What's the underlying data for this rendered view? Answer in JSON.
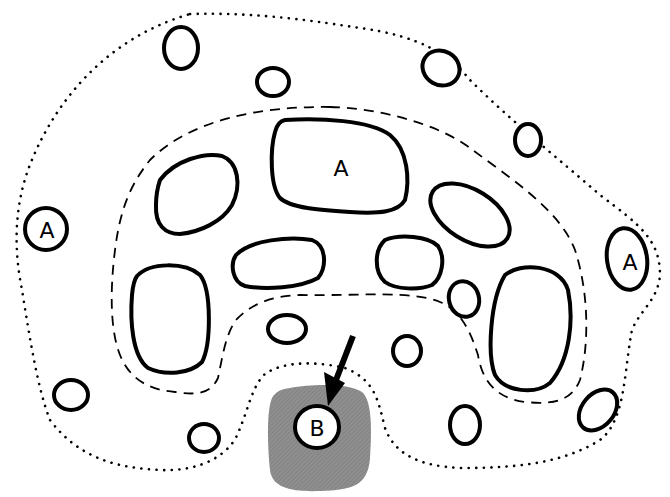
{
  "diagram": {
    "type": "region-cell-diagram",
    "labels": {
      "a_center": "A",
      "a_left": "A",
      "a_right": "A",
      "b": "B"
    },
    "regions": [
      {
        "name": "outer-region",
        "style": "dotted"
      },
      {
        "name": "inner-region",
        "style": "dashed"
      },
      {
        "name": "shaded-region",
        "style": "gray-fill"
      }
    ],
    "arrow": {
      "points_to": "B"
    },
    "colors": {
      "stroke": "#000000",
      "shade": "#8c8c8c",
      "background": "#ffffff"
    }
  }
}
